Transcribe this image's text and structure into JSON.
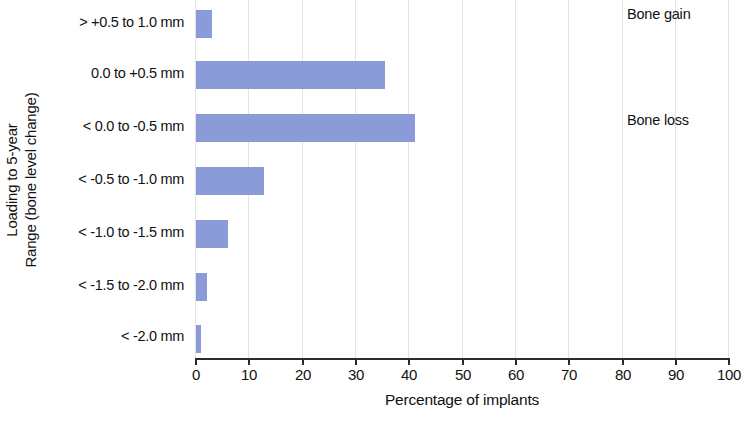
{
  "chart_data": {
    "type": "bar",
    "orientation": "horizontal",
    "title": "",
    "xlabel": "Percentage of implants",
    "ylabel": "Loading to 5-year Range (bone level change)",
    "ylabel_lines": [
      "Loading to 5-year",
      "Range (bone level change)"
    ],
    "categories": [
      "> +0.5 to 1.0 mm",
      "0.0 to +0.5 mm",
      "< 0.0 to -0.5 mm",
      "< -0.5 to -1.0 mm",
      "< -1.0 to -1.5 mm",
      "< -1.5 to -2.0 mm",
      "< -2.0 mm"
    ],
    "values": [
      3,
      35.5,
      41,
      12.8,
      6,
      2,
      1
    ],
    "xlim": [
      0,
      100
    ],
    "xticks": [
      0,
      10,
      20,
      30,
      40,
      50,
      60,
      70,
      80,
      90,
      100
    ],
    "xticklabels": [
      "0",
      "10",
      "20",
      "30",
      "40",
      "50",
      "60",
      "70",
      "80",
      "90",
      "100"
    ],
    "grid": "vertical",
    "legend": "none",
    "bar_color": "#8a9bd8",
    "axis_color": "#2b2b2b",
    "gridline_color": "#e2e2ea",
    "annotations": [
      {
        "text": "Bone gain",
        "category_index": 0
      },
      {
        "text": "Bone loss",
        "category_index": 2
      }
    ]
  }
}
